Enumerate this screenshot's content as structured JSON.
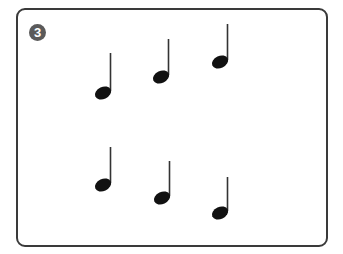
{
  "exercise": {
    "number": "3",
    "badge_color": "#5a5a5a",
    "frame_color": "#3a3a3a"
  },
  "notes": [
    {
      "type": "quarter-note",
      "row": 1,
      "head_x": 103,
      "head_y": 93,
      "stem_top": 53
    },
    {
      "type": "quarter-note",
      "row": 1,
      "head_x": 161,
      "head_y": 77,
      "stem_top": 39
    },
    {
      "type": "quarter-note",
      "row": 1,
      "head_x": 220,
      "head_y": 62,
      "stem_top": 24
    },
    {
      "type": "quarter-note",
      "row": 2,
      "head_x": 103,
      "head_y": 185,
      "stem_top": 147
    },
    {
      "type": "quarter-note",
      "row": 2,
      "head_x": 162,
      "head_y": 198,
      "stem_top": 161
    },
    {
      "type": "quarter-note",
      "row": 2,
      "head_x": 220,
      "head_y": 213,
      "stem_top": 177
    }
  ]
}
